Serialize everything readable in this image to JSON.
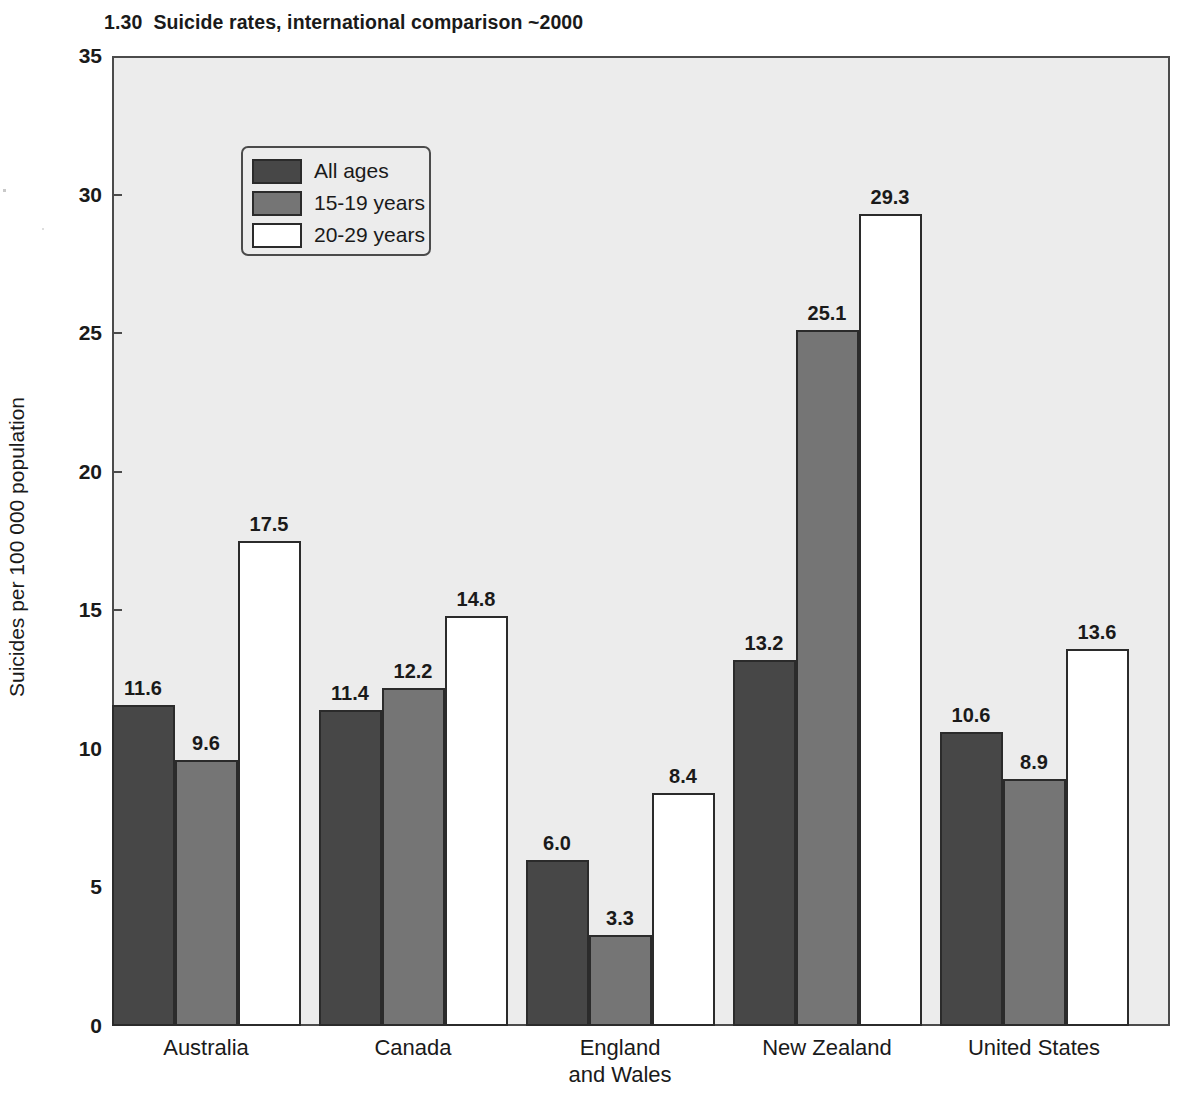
{
  "chart_data": {
    "type": "bar",
    "title": "1.30  Suicide rates, international comparison ~2000",
    "xlabel": "",
    "ylabel": "Suicides per 100 000 population",
    "ylim": [
      0,
      35
    ],
    "yticks": [
      "0",
      "5",
      "10",
      "15",
      "20",
      "25",
      "30",
      "35"
    ],
    "grid": false,
    "legend_position": "upper-left-inside",
    "categories": [
      "Australia",
      "Canada",
      "England and Wales",
      "New Zealand",
      "United States"
    ],
    "category_label_lines": [
      [
        "Australia"
      ],
      [
        "Canada"
      ],
      [
        "England",
        "and Wales"
      ],
      [
        "New Zealand"
      ],
      [
        "United States"
      ]
    ],
    "series": [
      {
        "name": "All ages",
        "color": "#474747",
        "values": [
          11.6,
          11.4,
          6.0,
          13.2,
          10.6
        ],
        "labels": [
          "11.6",
          "11.4",
          "6.0",
          "13.2",
          "10.6"
        ]
      },
      {
        "name": "15-19 years",
        "color": "#757575",
        "values": [
          9.6,
          12.2,
          3.3,
          25.1,
          8.9
        ],
        "labels": [
          "9.6",
          "12.2",
          "3.3",
          "25.1",
          "8.9"
        ]
      },
      {
        "name": "20-29 years",
        "color": "#ffffff",
        "values": [
          17.5,
          14.8,
          8.4,
          29.3,
          13.6
        ],
        "labels": [
          "17.5",
          "14.8",
          "8.4",
          "29.3",
          "13.6"
        ]
      }
    ]
  },
  "colors": {
    "plot_background": "#ececec",
    "frame": "#4b4b4b",
    "bar_outline": "#2b2b2b",
    "page_background": "#ffffff",
    "text": "#1a1a1a"
  }
}
